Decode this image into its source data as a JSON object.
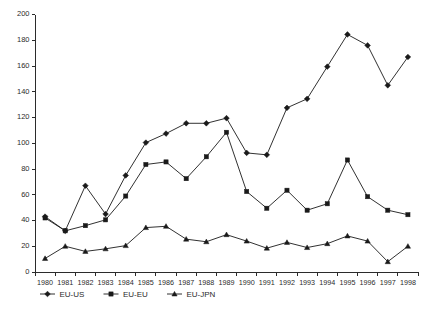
{
  "chart_data": {
    "type": "line",
    "title": "",
    "xlabel": "",
    "ylabel": "",
    "ylim": [
      0,
      200
    ],
    "y_ticks": [
      0,
      20,
      40,
      60,
      80,
      100,
      120,
      140,
      160,
      180,
      200
    ],
    "grid": false,
    "legend_position": "bottom",
    "categories": [
      "1980",
      "1981",
      "1982",
      "1983",
      "1984",
      "1985",
      "1986",
      "1987",
      "1988",
      "1989",
      "1990",
      "1991",
      "1992",
      "1993",
      "1994",
      "1995",
      "1996",
      "1997",
      "1998"
    ],
    "series": [
      {
        "name": "EU-US",
        "marker": "diamond",
        "values": [
          43,
          32,
          67,
          45,
          75,
          100.5,
          107.5,
          115.5,
          115.5,
          119.5,
          92.5,
          91,
          127.5,
          134.5,
          159.5,
          184.5,
          176,
          145,
          167
        ]
      },
      {
        "name": "EU-EU",
        "marker": "square",
        "values": [
          42,
          32,
          36,
          40.5,
          59,
          83.5,
          85.5,
          72.5,
          89.5,
          108.5,
          62.5,
          49.5,
          63.5,
          48,
          53,
          87,
          58.5,
          48,
          44.5
        ]
      },
      {
        "name": "EU-JPN",
        "marker": "triangle",
        "values": [
          10.5,
          20,
          16,
          18,
          20.5,
          34.5,
          35.5,
          25.5,
          23.5,
          29,
          24,
          18.5,
          23,
          19,
          22,
          28,
          24,
          8,
          20
        ]
      }
    ]
  },
  "legend": {
    "items": [
      {
        "label": "EU-US"
      },
      {
        "label": "EU-EU"
      },
      {
        "label": "EU-JPN"
      }
    ]
  }
}
